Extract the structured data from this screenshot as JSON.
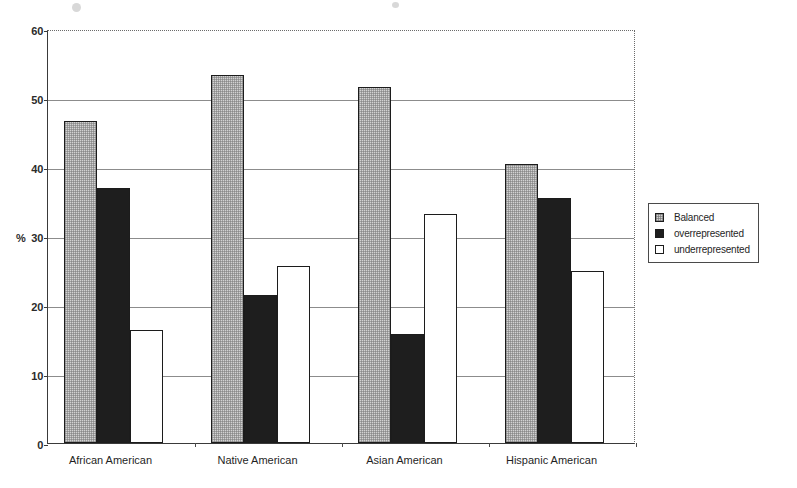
{
  "chart_data": {
    "type": "bar",
    "title": "",
    "xlabel": "",
    "ylabel": "%",
    "ylim": [
      0,
      60
    ],
    "ytick_values": [
      0,
      10,
      20,
      30,
      40,
      50,
      60
    ],
    "ytick_labels": [
      "0",
      "10",
      "20",
      "30",
      "40",
      "50",
      "60"
    ],
    "grid": true,
    "legend_position": "right",
    "categories": [
      "African American",
      "Native American",
      "Asian American",
      "Hispanic American"
    ],
    "series": [
      {
        "name": "Balanced",
        "color": "#d2d2d2",
        "values": [
          46.6,
          53.4,
          51.6,
          40.5
        ]
      },
      {
        "name": "overrepresented",
        "color": "#1e1e1e",
        "values": [
          37.0,
          21.5,
          15.8,
          35.5
        ]
      },
      {
        "name": "underrepresented",
        "color": "#ffffff",
        "values": [
          16.4,
          25.7,
          33.2,
          24.9
        ]
      }
    ]
  },
  "axis": {
    "y_title": "%"
  },
  "legend": {
    "items": [
      {
        "label": "Balanced",
        "swatch": "balanced-swatch"
      },
      {
        "label": "overrepresented",
        "swatch": "overrepresented-swatch"
      },
      {
        "label": "underrepresented",
        "swatch": "underrepresented-swatch"
      }
    ]
  }
}
